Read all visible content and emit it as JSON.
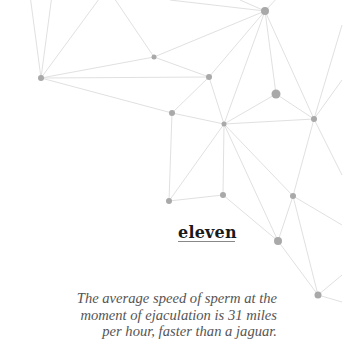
{
  "background": {
    "type": "network-graph",
    "line_color": "#d2d2d2",
    "node_color": "#a9a9a9",
    "nodes": [
      {
        "x": 265,
        "y": 11,
        "r": 4
      },
      {
        "x": 154,
        "y": 57,
        "r": 2.5
      },
      {
        "x": 41,
        "y": 78,
        "r": 3
      },
      {
        "x": 209,
        "y": 77,
        "r": 3
      },
      {
        "x": 276,
        "y": 94,
        "r": 4.5
      },
      {
        "x": 172,
        "y": 113,
        "r": 3
      },
      {
        "x": 224,
        "y": 124,
        "r": 2.5
      },
      {
        "x": 314,
        "y": 119,
        "r": 3
      },
      {
        "x": 169,
        "y": 201,
        "r": 3
      },
      {
        "x": 223,
        "y": 195,
        "r": 3
      },
      {
        "x": 293,
        "y": 196,
        "r": 3
      },
      {
        "x": 278,
        "y": 241,
        "r": 4
      },
      {
        "x": 318,
        "y": 295,
        "r": 3.5
      }
    ]
  },
  "card": {
    "number_word": "eleven",
    "fact_lines": [
      "The average speed of sperm at the",
      "moment of ejaculation is 31 miles",
      "per hour, faster than a jaguar."
    ]
  }
}
